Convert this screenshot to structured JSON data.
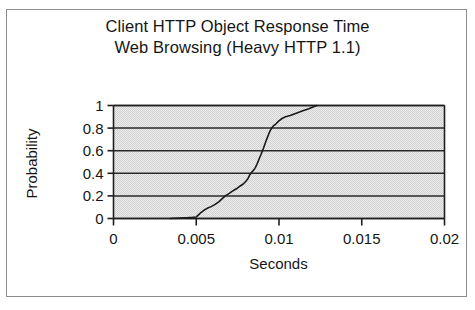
{
  "figure": {
    "title_lines": [
      "Client HTTP Object Response Time",
      "Web Browsing (Heavy HTTP 1.1)"
    ],
    "border_color": "#8c8c8c",
    "background": "#ffffff"
  },
  "chart_data": {
    "type": "line",
    "title": "Client HTTP Object Response Time\nWeb Browsing (Heavy HTTP 1.1)",
    "title_line_1": "Client HTTP Object Response Time",
    "title_line_2": "Web Browsing (Heavy HTTP 1.1)",
    "xlabel": "Seconds",
    "ylabel": "Probability",
    "xlim": [
      0,
      0.02
    ],
    "ylim": [
      0,
      1
    ],
    "xticks": [
      0,
      0.005,
      0.01,
      0.015,
      0.02
    ],
    "xtick_labels": [
      "0",
      "0.005",
      "0.01",
      "0.015",
      "0.02"
    ],
    "yticks": [
      0,
      0.2,
      0.4,
      0.6,
      0.8,
      1
    ],
    "ytick_labels": [
      "0",
      "0.2",
      "0.4",
      "0.6",
      "0.8",
      "1"
    ],
    "grid": "horizontal",
    "grid_color": "#2a2a2a",
    "plot_background": "#e2e2e2",
    "legend": null,
    "series": [
      {
        "name": "Client HTTP Object Response Time CDF",
        "color": "#1a1a1a",
        "line_width": 1.6,
        "x": [
          0.00342,
          0.004,
          0.0044,
          0.00478,
          0.005,
          0.00512,
          0.0053,
          0.00548,
          0.00566,
          0.0059,
          0.00614,
          0.00638,
          0.0066,
          0.0068,
          0.007,
          0.00716,
          0.0073,
          0.00748,
          0.00766,
          0.00784,
          0.008,
          0.00812,
          0.00824,
          0.00836,
          0.00848,
          0.00858,
          0.00866,
          0.00874,
          0.00882,
          0.0089,
          0.00898,
          0.00906,
          0.00914,
          0.00922,
          0.0093,
          0.00938,
          0.00946,
          0.00956,
          0.00968,
          0.00982,
          0.00998,
          0.01018,
          0.0104,
          0.01068,
          0.011,
          0.0114,
          0.0118,
          0.01228
        ],
        "y": [
          0.0,
          0.003,
          0.006,
          0.01,
          0.014,
          0.03,
          0.055,
          0.075,
          0.09,
          0.105,
          0.125,
          0.15,
          0.18,
          0.205,
          0.222,
          0.24,
          0.252,
          0.268,
          0.288,
          0.305,
          0.33,
          0.352,
          0.388,
          0.412,
          0.43,
          0.452,
          0.478,
          0.505,
          0.535,
          0.562,
          0.592,
          0.622,
          0.655,
          0.688,
          0.718,
          0.748,
          0.775,
          0.8,
          0.822,
          0.838,
          0.862,
          0.885,
          0.9,
          0.912,
          0.93,
          0.952,
          0.972,
          1.0
        ]
      }
    ]
  }
}
